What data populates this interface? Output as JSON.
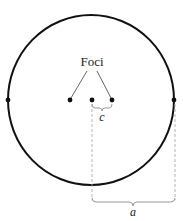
{
  "diagram": {
    "title_label": "Foci",
    "c_label": "c",
    "a_label": "a",
    "colors": {
      "stroke": "#111111",
      "leader": "#555555",
      "dashed": "#aaaaaa",
      "brace": "#999999",
      "background": "#ffffff"
    },
    "ellipse": {
      "cx": 91,
      "cy": 100,
      "rx": 83,
      "ry": 85
    },
    "points": {
      "left_vertex": {
        "x": 8,
        "y": 100
      },
      "left_focus": {
        "x": 70,
        "y": 100
      },
      "center": {
        "x": 92,
        "y": 100
      },
      "right_focus": {
        "x": 112,
        "y": 100
      },
      "right_vertex": {
        "x": 174,
        "y": 100
      }
    }
  }
}
